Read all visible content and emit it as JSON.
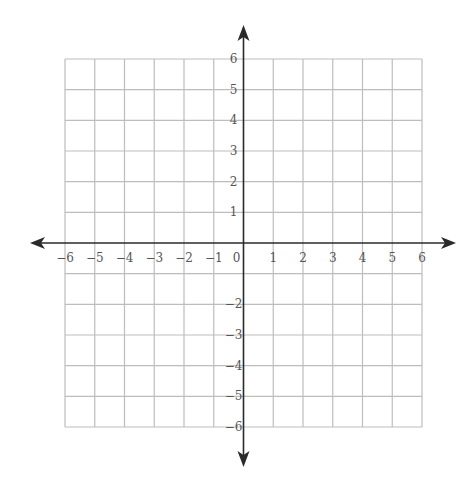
{
  "chart_data": {
    "type": "coordinate-plane",
    "title": "",
    "xlabel": "",
    "ylabel": "",
    "xlim": [
      -6,
      6
    ],
    "ylim": [
      -6,
      6
    ],
    "grid": true,
    "x_tick_labels": [
      "−6",
      "−5",
      "−4",
      "−3",
      "−2",
      "−1",
      "0",
      "1",
      "2",
      "3",
      "4",
      "5",
      "6"
    ],
    "x_tick_values": [
      -6,
      -5,
      -4,
      -3,
      -2,
      -1,
      0,
      1,
      2,
      3,
      4,
      5,
      6
    ],
    "y_tick_labels": [
      "6",
      "5",
      "4",
      "3",
      "2",
      "1",
      "−2",
      "−3",
      "−4",
      "−5",
      "−6"
    ],
    "y_tick_values": [
      6,
      5,
      4,
      3,
      2,
      1,
      -2,
      -3,
      -4,
      -5,
      -6
    ],
    "arrows": [
      "left",
      "right",
      "up",
      "down"
    ],
    "series": []
  },
  "colors": {
    "grid": "#bdbdbd",
    "axis": "#2a2a2a",
    "label": "#555555",
    "background": "#ffffff"
  },
  "layout": {
    "origin_px": [
      242,
      243
    ],
    "grid_left": 65,
    "grid_right": 422,
    "grid_top": 59,
    "grid_bottom": 427,
    "x_arrow": [
      30,
      456
    ],
    "y_arrow": [
      25,
      467
    ]
  }
}
